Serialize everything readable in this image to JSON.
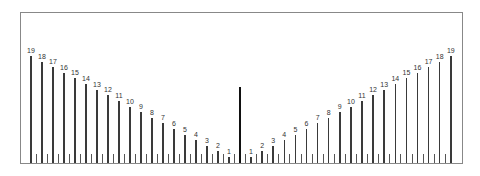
{
  "chart_data": {
    "type": "bar",
    "title": "",
    "xlabel": "",
    "ylabel": "",
    "left_side": {
      "labels": [
        "19",
        "18",
        "17",
        "16",
        "15",
        "14",
        "13",
        "12",
        "11",
        "10",
        "9",
        "8",
        "7",
        "6",
        "5",
        "4",
        "3",
        "2",
        "1"
      ],
      "values": [
        19,
        18,
        17,
        16,
        15,
        14,
        13,
        12,
        11,
        10,
        9,
        8,
        7,
        6,
        5,
        4,
        3,
        2,
        1
      ]
    },
    "right_side": {
      "labels": [
        "1",
        "2",
        "3",
        "4",
        "5",
        "6",
        "7",
        "8",
        "9",
        "10",
        "11",
        "12",
        "13",
        "14",
        "15",
        "16",
        "17",
        "18",
        "19"
      ],
      "values": [
        1,
        2,
        3,
        4,
        5,
        6,
        7,
        8,
        9,
        10,
        11,
        12,
        13,
        14,
        15,
        16,
        17,
        18,
        19
      ]
    },
    "center_marker": {
      "label": "",
      "height_equiv": 14
    },
    "grid": false,
    "legend": null,
    "minor_ticks": true
  },
  "colors": {
    "bars": "#3a3a3a",
    "center": "#111111",
    "frame": "#888888",
    "text": "#333333"
  }
}
